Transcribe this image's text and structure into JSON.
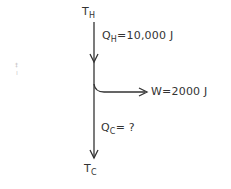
{
  "diagram": {
    "hot_reservoir": {
      "symbol": "T",
      "subscript": "H"
    },
    "cold_reservoir": {
      "symbol": "T",
      "subscript": "C"
    },
    "heat_in": {
      "symbol": "Q",
      "subscript": "H",
      "value": "=10,000 J"
    },
    "work_out": {
      "label": "W=2000 J"
    },
    "heat_out": {
      "symbol": "Q",
      "subscript": "C",
      "value": "= ?"
    },
    "colors": {
      "stroke": "#333333"
    },
    "margin_marks": [
      "‡",
      "⁞"
    ]
  }
}
